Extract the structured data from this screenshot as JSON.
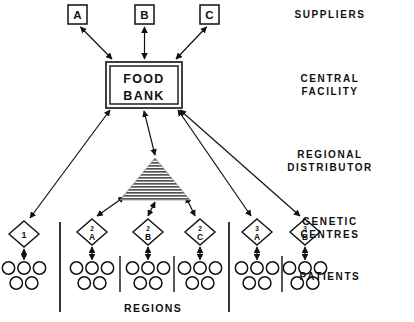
{
  "diagram": {
    "background_color": "#ffffff",
    "line_color": "#111111",
    "bottom_label": "REGIONS"
  },
  "tier_labels": [
    {
      "name": "suppliers",
      "lines": [
        "SUPPLIERS"
      ],
      "x": 330,
      "y": 8
    },
    {
      "name": "central-facility",
      "lines": [
        "CENTRAL",
        "FACILITY"
      ],
      "x": 330,
      "y": 72
    },
    {
      "name": "regional-distributor",
      "lines": [
        "REGIONAL",
        "DISTRIBUTOR"
      ],
      "x": 330,
      "y": 148
    },
    {
      "name": "genetic-centres",
      "lines": [
        "GENETIC",
        "CENTRES"
      ],
      "x": 330,
      "y": 215
    },
    {
      "name": "patients",
      "lines": [
        "PATIENTS"
      ],
      "x": 330,
      "y": 270
    }
  ],
  "suppliers": [
    {
      "id": "supplier-a",
      "label": "A",
      "x": 68,
      "y": 5,
      "w": 19,
      "h": 19
    },
    {
      "id": "supplier-b",
      "label": "B",
      "x": 135,
      "y": 5,
      "w": 19,
      "h": 19
    },
    {
      "id": "supplier-c",
      "label": "C",
      "x": 200,
      "y": 5,
      "w": 19,
      "h": 19
    }
  ],
  "central_facility": {
    "id": "food-bank",
    "lines": [
      "FOOD",
      "BANK"
    ],
    "x": 106,
    "y": 62,
    "w": 76,
    "h": 46
  },
  "regional_distributor": {
    "id": "regional-distributor-triangle",
    "apex_x": 155,
    "apex_y": 158,
    "base_y": 200,
    "half_width": 35,
    "fill": "hatched"
  },
  "genetic_centres": [
    {
      "id": "gc-1",
      "top": "",
      "label": "1",
      "cx": 24,
      "cy": 234
    },
    {
      "id": "gc-2a",
      "top": "2",
      "label": "A",
      "cx": 92,
      "cy": 232
    },
    {
      "id": "gc-2b",
      "top": "2",
      "label": "B",
      "cx": 148,
      "cy": 232
    },
    {
      "id": "gc-2c",
      "top": "2",
      "label": "C",
      "cx": 200,
      "cy": 232
    },
    {
      "id": "gc-3a",
      "top": "3",
      "label": "A",
      "cx": 257,
      "cy": 232
    },
    {
      "id": "gc-3b",
      "top": "3",
      "label": "B",
      "cx": 305,
      "cy": 232
    }
  ],
  "patient_groups": [
    {
      "id": "patients-1",
      "cx": 24,
      "top_count": 3,
      "bottom_count": 2
    },
    {
      "id": "patients-2a",
      "cx": 92,
      "top_count": 3,
      "bottom_count": 2
    },
    {
      "id": "patients-2b",
      "cx": 148,
      "top_count": 3,
      "bottom_count": 2
    },
    {
      "id": "patients-2c",
      "cx": 200,
      "top_count": 3,
      "bottom_count": 2
    },
    {
      "id": "patients-3a",
      "cx": 257,
      "top_count": 3,
      "bottom_count": 2
    },
    {
      "id": "patients-3b",
      "cx": 305,
      "top_count": 3,
      "bottom_count": 2
    }
  ],
  "region_dividers": [
    {
      "id": "divider-region-1",
      "x": 60,
      "y1": 222,
      "y2": 312,
      "kind": "tall"
    },
    {
      "id": "divider-sub-2a",
      "x": 120,
      "y1": 256,
      "y2": 292,
      "kind": "short"
    },
    {
      "id": "divider-sub-2b",
      "x": 174,
      "y1": 256,
      "y2": 292,
      "kind": "short"
    },
    {
      "id": "divider-region-2",
      "x": 229,
      "y1": 222,
      "y2": 312,
      "kind": "tall"
    },
    {
      "id": "divider-sub-3a",
      "x": 282,
      "y1": 256,
      "y2": 292,
      "kind": "short"
    }
  ]
}
